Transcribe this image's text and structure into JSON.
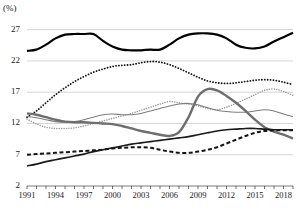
{
  "chart_data": {
    "type": "line",
    "title": "",
    "subtitle": "",
    "xlabel": "",
    "ylabel": "(%)",
    "unit_label": "(%)",
    "grid": true,
    "legend_position": "none",
    "xlim": [
      1991,
      2019
    ],
    "ylim": [
      2,
      29.5
    ],
    "yticks": [
      27,
      22,
      17,
      12,
      7,
      2
    ],
    "ytick_labels": [
      "27",
      "22",
      "17",
      "12",
      "7",
      "2"
    ],
    "xticks": [
      1991,
      1994,
      1997,
      2000,
      2003,
      2006,
      2009,
      2012,
      2015,
      2018
    ],
    "xtick_labels": [
      "1991",
      "1994",
      "1997",
      "2000",
      "2003",
      "2006",
      "2009",
      "2012",
      "2015",
      "2018"
    ],
    "x": [
      1991,
      1992,
      1993,
      1994,
      1995,
      1996,
      1997,
      1998,
      1999,
      2000,
      2001,
      2002,
      2003,
      2004,
      2005,
      2006,
      2007,
      2008,
      2009,
      2010,
      2011,
      2012,
      2013,
      2014,
      2015,
      2016,
      2017,
      2018,
      2019
    ],
    "series": [
      {
        "name": "series-1-solid-black-thick",
        "style": "solid",
        "color": "#000000",
        "width": 2.2,
        "values": [
          23.6,
          23.8,
          24.6,
          25.6,
          26.2,
          26.3,
          26.3,
          26.3,
          25.2,
          24.3,
          23.8,
          23.7,
          23.7,
          23.8,
          23.8,
          24.6,
          25.6,
          26.2,
          26.4,
          26.4,
          26.2,
          25.6,
          24.6,
          24.1,
          24.0,
          24.3,
          25.1,
          25.8,
          26.5
        ]
      },
      {
        "name": "series-2-dotted-black",
        "style": "dotted",
        "color": "#151515",
        "width": 1.8,
        "values": [
          13.0,
          14.0,
          15.3,
          16.6,
          17.7,
          18.7,
          19.5,
          20.2,
          20.7,
          21.1,
          21.3,
          21.4,
          21.7,
          21.9,
          21.8,
          21.4,
          20.8,
          20.1,
          19.4,
          18.8,
          18.5,
          18.4,
          18.5,
          18.7,
          18.9,
          19.0,
          18.9,
          18.6,
          18.2
        ]
      },
      {
        "name": "series-3-dotted-gray-light",
        "style": "dotted",
        "color": "#9a9a9a",
        "width": 1.5,
        "values": [
          12.7,
          11.9,
          11.4,
          11.2,
          11.2,
          11.3,
          11.6,
          12.0,
          12.4,
          12.8,
          13.2,
          13.6,
          14.1,
          14.6,
          15.1,
          15.5,
          15.3,
          15.1,
          14.8,
          14.4,
          14.2,
          14.6,
          15.2,
          15.9,
          16.6,
          17.3,
          17.5,
          17.1,
          16.5
        ]
      },
      {
        "name": "series-4-solid-gray-thin",
        "style": "solid",
        "color": "#7d7d7d",
        "width": 1.1,
        "values": [
          13.1,
          12.9,
          12.6,
          12.3,
          12.2,
          12.3,
          12.6,
          13.0,
          13.4,
          13.5,
          13.4,
          13.4,
          13.6,
          14.0,
          14.4,
          14.8,
          15.1,
          15.2,
          15.0,
          14.5,
          14.1,
          13.9,
          13.8,
          13.8,
          14.0,
          14.2,
          14.0,
          13.5,
          13.1
        ]
      },
      {
        "name": "series-5-solid-gray-thick",
        "style": "solid",
        "color": "#6e6e6e",
        "width": 2.4,
        "values": [
          13.6,
          13.4,
          13.0,
          12.6,
          12.3,
          12.2,
          12.2,
          12.1,
          12.0,
          11.9,
          11.6,
          11.2,
          10.8,
          10.5,
          10.2,
          10.0,
          10.6,
          13.0,
          16.3,
          17.5,
          17.3,
          16.4,
          15.3,
          14.0,
          12.6,
          11.4,
          10.7,
          10.2,
          9.6
        ]
      },
      {
        "name": "series-6-dashed-black",
        "style": "dashed",
        "color": "#141414",
        "width": 2.0,
        "values": [
          7.0,
          7.1,
          7.2,
          7.3,
          7.4,
          7.5,
          7.6,
          7.7,
          7.8,
          8.0,
          8.1,
          8.2,
          8.2,
          8.1,
          7.8,
          7.5,
          7.3,
          7.3,
          7.5,
          7.8,
          8.2,
          8.8,
          9.4,
          10.0,
          10.5,
          10.8,
          10.9,
          10.9,
          10.9
        ]
      },
      {
        "name": "series-7-solid-black-thin",
        "style": "solid",
        "color": "#1a1a1a",
        "width": 1.6,
        "values": [
          5.2,
          5.5,
          5.9,
          6.2,
          6.5,
          6.8,
          7.1,
          7.5,
          7.8,
          8.1,
          8.4,
          8.7,
          8.9,
          9.1,
          9.3,
          9.5,
          9.7,
          9.9,
          10.2,
          10.5,
          10.8,
          11.0,
          11.1,
          11.2,
          11.2,
          11.1,
          11.0,
          11.0,
          11.0
        ]
      }
    ]
  },
  "caption": {
    "text": ""
  }
}
